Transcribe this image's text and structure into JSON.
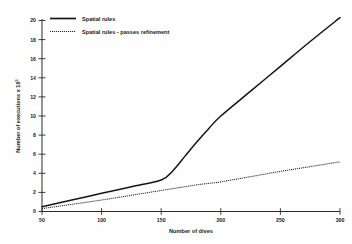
{
  "chart_data": {
    "type": "line",
    "title": "",
    "xlabel": "Number of dives",
    "ylabel": "Number of executions x 10",
    "ylabel_exponent": "5",
    "xlim": [
      50,
      300
    ],
    "ylim": [
      0,
      20
    ],
    "xticks": [
      50,
      100,
      150,
      200,
      250,
      300
    ],
    "yticks": [
      0,
      2,
      4,
      6,
      8,
      10,
      12,
      14,
      16,
      18,
      20
    ],
    "xtick_labels": [
      "50",
      "100",
      "150",
      "200",
      "250",
      "300"
    ],
    "ytick_labels": [
      "0",
      "2",
      "4",
      "6",
      "8",
      "10",
      "12",
      "14",
      "16",
      "18",
      "20"
    ],
    "grid": false,
    "legend_position": "top-left",
    "x": [
      50,
      75,
      100,
      125,
      150,
      160,
      170,
      180,
      190,
      200,
      225,
      250,
      275,
      300
    ],
    "series": [
      {
        "name": "Spatial rules",
        "style": "solid",
        "color": "#151515",
        "values": [
          0.5,
          1.2,
          1.9,
          2.6,
          3.3,
          4.3,
          5.8,
          7.3,
          8.7,
          10.0,
          12.6,
          15.2,
          17.8,
          20.3
        ]
      },
      {
        "name": "Spatial rules - passes refinement",
        "style": "dotted",
        "color": "#2b2b2b",
        "values": [
          0.3,
          0.75,
          1.2,
          1.7,
          2.2,
          2.4,
          2.6,
          2.8,
          2.95,
          3.1,
          3.65,
          4.2,
          4.7,
          5.2
        ]
      }
    ]
  },
  "legend": {
    "items": [
      {
        "label": "Spatial rules"
      },
      {
        "label": "Spatial rules - passes refinement"
      }
    ]
  }
}
